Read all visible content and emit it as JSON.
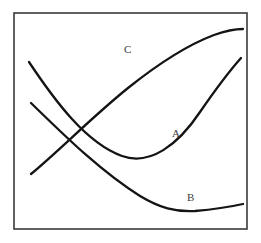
{
  "figure": {
    "background_color": "#ffffff",
    "frame": {
      "name": "plot-frame",
      "x": 14,
      "y": 13,
      "width": 233,
      "height": 216,
      "stroke_color": "#3a3a3a",
      "stroke_width": 1.6,
      "fill": "#ffffff"
    },
    "labels": [
      {
        "id": "A",
        "text": "A",
        "x": 172,
        "y": 128
      },
      {
        "id": "B",
        "text": "B",
        "x": 187,
        "y": 192
      },
      {
        "id": "C",
        "text": "C",
        "x": 124,
        "y": 44
      }
    ]
  },
  "chart_data": {
    "type": "line",
    "title": "",
    "xlabel": "",
    "ylabel": "",
    "xlim": [
      14,
      247
    ],
    "ylim": [
      13,
      229
    ],
    "grid": false,
    "legend": "inline-labels",
    "axis_ticks": false,
    "line_color": "#141414",
    "line_width": 2.3,
    "series": [
      {
        "name": "A",
        "label": "A",
        "shape": "u-curve-convex",
        "description": "Descends from upper-left, reaches a minimum near the lower-middle, then rises steeply to the upper-right.",
        "path": "M 29 62 C 55 101, 86 143, 122 156 C 150 166, 178 145, 200 112 C 220 83, 233 67, 241 58",
        "points": [
          {
            "x": 29,
            "y": 62
          },
          {
            "x": 50,
            "y": 94
          },
          {
            "x": 70,
            "y": 120
          },
          {
            "x": 95,
            "y": 143
          },
          {
            "x": 122,
            "y": 156
          },
          {
            "x": 140,
            "y": 159
          },
          {
            "x": 160,
            "y": 152
          },
          {
            "x": 182,
            "y": 133
          },
          {
            "x": 205,
            "y": 105
          },
          {
            "x": 225,
            "y": 78
          },
          {
            "x": 241,
            "y": 58
          }
        ],
        "minimum": {
          "x": 140,
          "y": 159
        },
        "start": {
          "x": 29,
          "y": 62
        },
        "end": {
          "x": 241,
          "y": 58
        }
      },
      {
        "name": "B",
        "label": "B",
        "shape": "shallow-decreasing-then-flat",
        "description": "Descends from the left edge, flattens into a broad shallow minimum, then rises slightly to the right edge.",
        "path": "M 31 103 C 63 134, 100 171, 140 196 C 160 208, 175 212, 195 211 C 218 209, 234 206, 243 204",
        "points": [
          {
            "x": 31,
            "y": 103
          },
          {
            "x": 55,
            "y": 127
          },
          {
            "x": 80,
            "y": 152
          },
          {
            "x": 105,
            "y": 174
          },
          {
            "x": 130,
            "y": 191
          },
          {
            "x": 155,
            "y": 204
          },
          {
            "x": 183,
            "y": 212
          },
          {
            "x": 205,
            "y": 210
          },
          {
            "x": 225,
            "y": 207
          },
          {
            "x": 243,
            "y": 204
          }
        ],
        "minimum": {
          "x": 183,
          "y": 212
        },
        "start": {
          "x": 31,
          "y": 103
        },
        "end": {
          "x": 243,
          "y": 204
        }
      },
      {
        "name": "C",
        "label": "C",
        "shape": "concave-increasing-saturating",
        "description": "Rises from the lower-left, climbs steeply through the middle, then flattens near the top-right.",
        "path": "M 31 174 C 60 150, 92 117, 128 88 C 158 64, 190 44, 214 35 C 228 30, 238 29, 243 29",
        "points": [
          {
            "x": 31,
            "y": 174
          },
          {
            "x": 50,
            "y": 158
          },
          {
            "x": 70,
            "y": 139
          },
          {
            "x": 95,
            "y": 115
          },
          {
            "x": 120,
            "y": 94
          },
          {
            "x": 145,
            "y": 76
          },
          {
            "x": 170,
            "y": 60
          },
          {
            "x": 195,
            "y": 45
          },
          {
            "x": 218,
            "y": 34
          },
          {
            "x": 243,
            "y": 29
          }
        ],
        "start": {
          "x": 31,
          "y": 174
        },
        "end": {
          "x": 243,
          "y": 29
        }
      }
    ],
    "intersections": [
      {
        "between": [
          "A",
          "B"
        ],
        "x": 66,
        "y": 128
      },
      {
        "between": [
          "A",
          "C"
        ],
        "x": 66,
        "y": 118
      },
      {
        "between": [
          "B",
          "C"
        ],
        "x": 57,
        "y": 131
      }
    ]
  }
}
